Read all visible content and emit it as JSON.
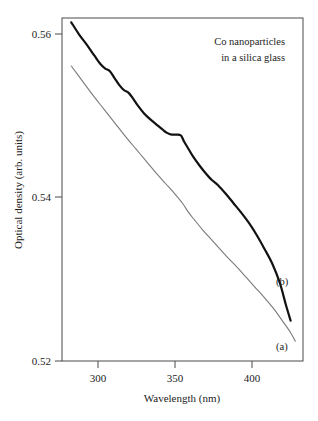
{
  "chart_data": {
    "type": "line",
    "title": "",
    "xlabel": "Wavelength (nm)",
    "ylabel": "Optical density (arb. units)",
    "xlim": [
      277,
      433
    ],
    "ylim": [
      0.52,
      0.56
    ],
    "xticks": [
      300,
      350,
      400
    ],
    "xticklabels": [
      "300",
      "350",
      "400"
    ],
    "yticks": [
      0.52,
      0.54,
      0.56
    ],
    "yticklabels": [
      "0.52",
      "0.54",
      "0.56"
    ],
    "grid": false,
    "legend_position": "inline-curve-labels",
    "annotations": [
      {
        "name": "sample-annotation-line1",
        "text": "Co nanoparticles"
      },
      {
        "name": "sample-annotation-line2",
        "text": "in a silica glass"
      }
    ],
    "series": [
      {
        "name": "(b)",
        "label": "(b)",
        "style": "thick-black",
        "color": "#121212",
        "linewidth": 2.2,
        "x": [
          283,
          288,
          293,
          298,
          302,
          305,
          308,
          311,
          314,
          317,
          320,
          323,
          326,
          330,
          334,
          338,
          342,
          345,
          348,
          351,
          354,
          356,
          359,
          362,
          366,
          370,
          374,
          378,
          383,
          388,
          393,
          398,
          403,
          408,
          413,
          418,
          422,
          425
        ],
        "y": [
          0.5595,
          0.5581,
          0.5569,
          0.5556,
          0.5546,
          0.5541,
          0.5538,
          0.553,
          0.5522,
          0.5516,
          0.5513,
          0.5506,
          0.5498,
          0.5489,
          0.5482,
          0.5476,
          0.547,
          0.5466,
          0.5464,
          0.5464,
          0.5463,
          0.5456,
          0.5447,
          0.5438,
          0.5428,
          0.5419,
          0.5411,
          0.5405,
          0.5395,
          0.5384,
          0.5373,
          0.5361,
          0.5347,
          0.5331,
          0.5314,
          0.5291,
          0.5265,
          0.5247
        ]
      },
      {
        "name": "(a)",
        "label": "(a)",
        "style": "thin-gray",
        "color": "#7a7a7a",
        "linewidth": 1.1,
        "x": [
          283,
          290,
          297,
          304,
          311,
          318,
          325,
          332,
          338,
          344,
          350,
          355,
          359,
          363,
          368,
          373,
          378,
          384,
          390,
          396,
          402,
          408,
          414,
          420,
          425,
          428
        ],
        "y": [
          0.5544,
          0.5527,
          0.551,
          0.5494,
          0.5478,
          0.5462,
          0.5447,
          0.5432,
          0.5419,
          0.5407,
          0.5395,
          0.5384,
          0.5373,
          0.5364,
          0.5353,
          0.5343,
          0.5333,
          0.5321,
          0.531,
          0.5298,
          0.5286,
          0.5274,
          0.5261,
          0.5246,
          0.5233,
          0.5223
        ]
      }
    ]
  },
  "colors": {
    "background": "#ffffff",
    "frame": "#4a4a4a",
    "text": "#1c1c1c",
    "series_b": "#121212",
    "series_a": "#7a7a7a"
  }
}
